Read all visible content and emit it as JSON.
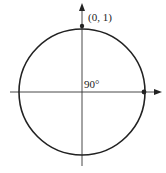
{
  "diagram": {
    "type": "unit-circle",
    "labels": {
      "point_top": "(0, 1)",
      "angle": "90°"
    },
    "points": [
      {
        "name": "top",
        "coords": "(0, 1)"
      },
      {
        "name": "right",
        "coords": "(1, 0)"
      }
    ],
    "colors": {
      "stroke": "#222222",
      "background": "#ffffff"
    }
  }
}
